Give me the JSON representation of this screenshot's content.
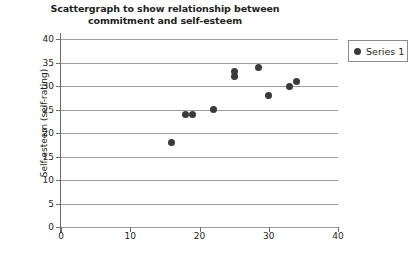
{
  "chart_data": {
    "type": "scatter",
    "title": "Scattergraph to show relationship between commitment and self-esteem",
    "title_line1": "Scattergraph to show relationship between",
    "title_line2": "commitment and self-esteem",
    "xlabel": "",
    "ylabel": "Self-esteem (self-rating)",
    "xlim": [
      0,
      40
    ],
    "ylim": [
      0,
      40
    ],
    "xticks": [
      0,
      10,
      20,
      30,
      40
    ],
    "yticks": [
      0,
      5,
      10,
      15,
      20,
      25,
      30,
      35,
      40
    ],
    "xtick_labels": [
      "0",
      "10",
      "20",
      "30",
      "40"
    ],
    "ytick_labels": [
      "0",
      "5",
      "10",
      "15",
      "20",
      "25",
      "30",
      "35",
      "40"
    ],
    "grid": "horizontal",
    "legend_position": "top-right",
    "marker_color": "#3a3a3a",
    "series": [
      {
        "name": "Series 1",
        "points": [
          {
            "x": 16,
            "y": 18
          },
          {
            "x": 18,
            "y": 24
          },
          {
            "x": 19,
            "y": 24
          },
          {
            "x": 22,
            "y": 25
          },
          {
            "x": 25,
            "y": 32
          },
          {
            "x": 25,
            "y": 33
          },
          {
            "x": 28.5,
            "y": 34
          },
          {
            "x": 30,
            "y": 28
          },
          {
            "x": 33,
            "y": 30
          },
          {
            "x": 34,
            "y": 31
          }
        ]
      }
    ]
  },
  "legend": {
    "entries": [
      "Series 1"
    ]
  }
}
